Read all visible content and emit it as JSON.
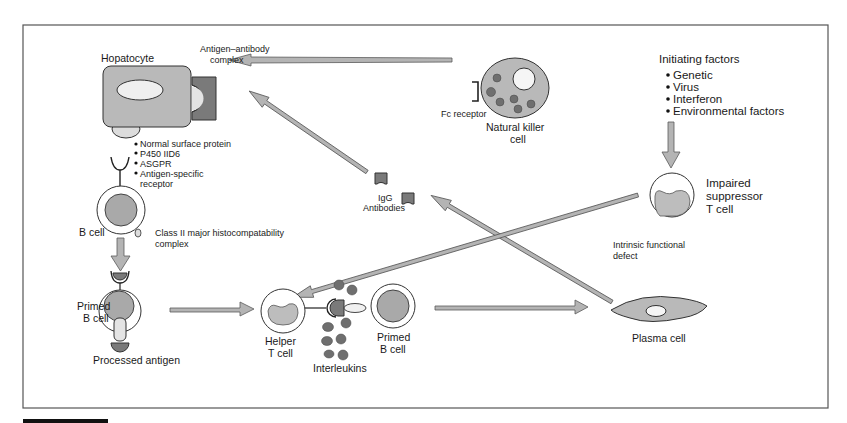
{
  "diagram": {
    "colors": {
      "cell_fill": "#b9b9b9",
      "arrow_fill": "#b4b4b4",
      "dark_gray": "#7a7a7a",
      "frame": "#555555"
    },
    "nodes": {
      "hepatocyte": {
        "label": "Hopatocyte"
      },
      "antigen_antibody_complex": {
        "line1": "Antigen–antibody",
        "line2": "complex"
      },
      "surface_proteins": {
        "items": [
          "Normal surface protein",
          "P450 IID6",
          "ASGPR",
          "Antigen-specific"
        ],
        "item4_cont": "receptor"
      },
      "b_cell": {
        "label": "B cell"
      },
      "mhc": {
        "line1": "Class II major histocompatability",
        "line2": "complex"
      },
      "primed_b_cell_left": {
        "line1": "Primed",
        "line2": "B cell"
      },
      "processed_antigen": {
        "label": "Processed antigen"
      },
      "helper_t_cell": {
        "line1": "Helper",
        "line2": "T cell"
      },
      "interleukins": {
        "label": "Interleukins"
      },
      "primed_b_cell_mid": {
        "line1": "Primed",
        "line2": "B cell"
      },
      "igg": {
        "line1": "IgG",
        "line2": "Antibodies"
      },
      "fc_receptor": {
        "label": "Fc receptor"
      },
      "nk_cell": {
        "line1": "Natural killer",
        "line2": "cell"
      },
      "initiating_factors": {
        "title": "Initiating factors",
        "items": [
          "Genetic",
          "Virus",
          "Interferon",
          "Environmental factors"
        ]
      },
      "suppressor_t_cell": {
        "line1": "Impaired",
        "line2": "suppressor",
        "line3": "T cell"
      },
      "intrinsic_defect": {
        "line1": "Intrinsic functional",
        "line2": "defect"
      },
      "plasma_cell": {
        "label": "Plasma cell"
      }
    },
    "edges": [
      {
        "from": "nk_cell",
        "to": "hepatocyte"
      },
      {
        "from": "igg",
        "to": "hepatocyte"
      },
      {
        "from": "plasma_cell",
        "to": "igg"
      },
      {
        "from": "suppressor_t_cell",
        "to": "helper_t_cell"
      },
      {
        "from": "initiating_factors",
        "to": "suppressor_t_cell"
      },
      {
        "from": "b_cell",
        "to": "primed_b_cell_left"
      },
      {
        "from": "primed_b_cell_left",
        "to": "helper_t_cell"
      },
      {
        "from": "primed_b_cell_mid",
        "to": "plasma_cell"
      }
    ]
  }
}
